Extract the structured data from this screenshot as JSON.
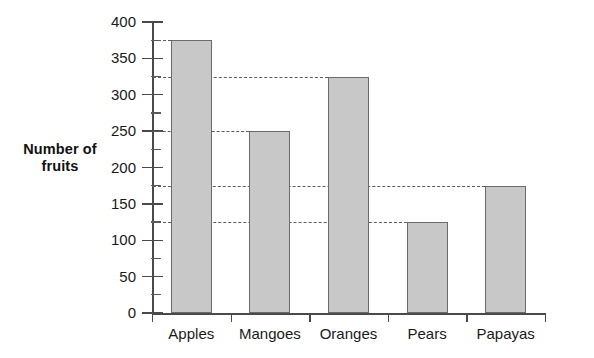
{
  "chart_data": {
    "type": "bar",
    "title": "",
    "xlabel": "",
    "ylabel": "Number of fruits",
    "categories": [
      "Apples",
      "Mangoes",
      "Oranges",
      "Pears",
      "Papayas"
    ],
    "values": [
      375,
      250,
      325,
      125,
      175
    ],
    "ylim": [
      0,
      400
    ],
    "y_major_ticks": [
      0,
      50,
      100,
      150,
      200,
      250,
      300,
      350,
      400
    ],
    "y_minor_ticks": [
      25,
      75,
      125,
      175,
      225,
      275,
      325,
      375
    ],
    "y_tick_labels": [
      "0",
      "50",
      "100",
      "150",
      "200",
      "250",
      "300",
      "350",
      "400"
    ],
    "grid": false,
    "leader_lines": true,
    "legend": null,
    "bar_fill_color": "#c8c8c8",
    "bar_border_color": "#6b6b6b",
    "axis_color": "#4a4a4a",
    "leader_line_color": "#5c5c5c",
    "background_color": "#ffffff"
  },
  "axis_label": {
    "line1": "Number of",
    "line2": "fruits"
  }
}
